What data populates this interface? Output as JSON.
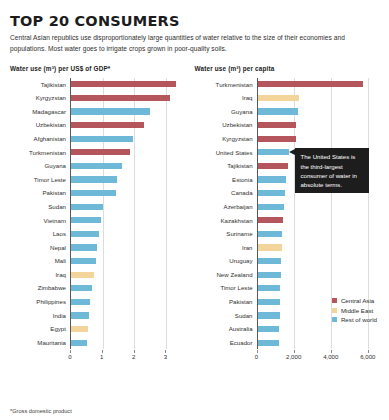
{
  "header": {
    "title": "TOP 20 CONSUMERS",
    "subtitle": "Central Asian republics use disproportionately large quantities of water relative to the size of their economies and populations. Most water goes to irrigate crops grown in poor-quality soils."
  },
  "footnote": "*Gross domestic product",
  "colors": {
    "central_asia": "#b4565b",
    "middle_east": "#f3d49a",
    "rest_of_world": "#6fb9d8",
    "gridline": "#dcdcdc",
    "axis": "#5a5a5a",
    "callout_bg": "#1d1d1d"
  },
  "legend": {
    "items": [
      {
        "label": "Central Asia",
        "color": "#b4565b"
      },
      {
        "label": "Middle East",
        "color": "#f3d49a"
      },
      {
        "label": "Rest of world",
        "color": "#6fb9d8"
      }
    ]
  },
  "callout": {
    "text": "The United States is the third-largest consumer of water in absolute terms."
  },
  "chart_data": [
    {
      "type": "bar",
      "orientation": "horizontal",
      "id": "water-use-per-gdp",
      "title": "Water use (m³) per US$ of GDP*",
      "xlabel": "",
      "ylabel": "",
      "xlim": [
        0,
        3.6
      ],
      "ticks": [
        0,
        1,
        2,
        3
      ],
      "tick_labels": [
        "0",
        "1",
        "2",
        "3"
      ],
      "grid": true,
      "legend_position": "none",
      "categories": [
        "Tajikistan",
        "Kyrgyzstan",
        "Madagascar",
        "Uzbekistan",
        "Afghanistan",
        "Turkmenistan",
        "Guyana",
        "Timor Leste",
        "Pakistan",
        "Sudan",
        "Vietnam",
        "Laos",
        "Nepal",
        "Mali",
        "Iraq",
        "Zimbabwe",
        "Philippines",
        "India",
        "Egypt",
        "Mauritania"
      ],
      "values": [
        3.32,
        3.14,
        2.52,
        2.33,
        1.96,
        1.87,
        1.62,
        1.47,
        1.42,
        1.0,
        0.95,
        0.9,
        0.83,
        0.8,
        0.73,
        0.65,
        0.6,
        0.57,
        0.53,
        0.5
      ],
      "groups": [
        "Central Asia",
        "Central Asia",
        "Rest of world",
        "Central Asia",
        "Rest of world",
        "Central Asia",
        "Rest of world",
        "Rest of world",
        "Rest of world",
        "Rest of world",
        "Rest of world",
        "Rest of world",
        "Rest of world",
        "Rest of world",
        "Middle East",
        "Rest of world",
        "Rest of world",
        "Rest of world",
        "Middle East",
        "Rest of world"
      ]
    },
    {
      "type": "bar",
      "orientation": "horizontal",
      "id": "water-use-per-capita",
      "title": "Water use (m³) per capita",
      "xlabel": "",
      "ylabel": "",
      "xlim": [
        0,
        6600
      ],
      "ticks": [
        0,
        2000,
        4000,
        6000
      ],
      "tick_labels": [
        "0",
        "2,000",
        "4,000",
        "6,000"
      ],
      "grid": true,
      "legend_position": "bottom-right",
      "categories": [
        "Turkmenistan",
        "Iraq",
        "Guyana",
        "Uzbekistan",
        "Kyrgyzstan",
        "United States",
        "Tajikistan",
        "Estonia",
        "Canada",
        "Azerbaijan",
        "Kazakhstan",
        "Suriname",
        "Iran",
        "Uruguay",
        "New Zealand",
        "Timor Leste",
        "Pakistan",
        "Sudan",
        "Australia",
        "Ecuador"
      ],
      "values": [
        5750,
        2250,
        2180,
        2080,
        2070,
        1700,
        1680,
        1560,
        1490,
        1440,
        1400,
        1340,
        1310,
        1290,
        1260,
        1240,
        1220,
        1200,
        1180,
        1160
      ],
      "groups": [
        "Central Asia",
        "Middle East",
        "Rest of world",
        "Central Asia",
        "Central Asia",
        "Rest of world",
        "Central Asia",
        "Rest of world",
        "Rest of world",
        "Rest of world",
        "Central Asia",
        "Rest of world",
        "Middle East",
        "Rest of world",
        "Rest of world",
        "Rest of world",
        "Rest of world",
        "Rest of world",
        "Rest of world",
        "Rest of world"
      ],
      "annotated_category": "United States"
    }
  ]
}
